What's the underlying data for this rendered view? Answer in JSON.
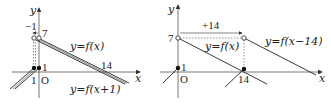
{
  "left_graph": {
    "axis_x_label": "x",
    "axis_y_label": "y",
    "origin_label": "O",
    "shift_label": "−1",
    "y_intercept_label": "7",
    "point_label_1": "1",
    "point_label_neg1": "1",
    "x_intercept_label": "14",
    "curve_original_label": "y=f(x)",
    "curve_shifted_label": "y=f(x+1)"
  },
  "right_graph": {
    "axis_x_label": "x",
    "axis_y_label": "y",
    "origin_label": "O",
    "shift_label": "+14",
    "y_intercept_label": "7",
    "point_label_1": "1",
    "x_intercept_label": "14",
    "curve_original_label": "y=f(x)",
    "curve_shifted_label": "y=f(x−14)"
  },
  "colors": {
    "line": "#222222",
    "axis": "#555555"
  }
}
